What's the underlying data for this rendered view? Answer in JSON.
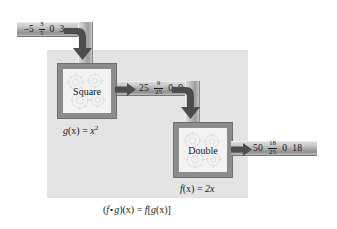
{
  "diagram": {
    "bottom_formula": "( f ∘ g )( x )  =  f [ g ( x ) ]",
    "bottom_formula_parts": {
      "open": "(",
      "f": "f",
      "ring": "∘",
      "g": "g",
      "close_x": ")(x)",
      "equals": "=",
      "f2": "f",
      "bracket_open": "[",
      "g2": "g",
      "gx": "(x)",
      "bracket_close": "]"
    },
    "panel_color": "#e3e3e3",
    "band_color": "#a8a8a8",
    "machine_border_color": "#8c8c8c",
    "arrow_color": "#4d4d4d"
  },
  "input_band": {
    "name": "input-values",
    "values": [
      {
        "type": "number",
        "text": "–5"
      },
      {
        "type": "fraction",
        "numerator": "3",
        "denominator": "5"
      },
      {
        "type": "number",
        "text": "0"
      },
      {
        "type": "number",
        "text": "3"
      }
    ]
  },
  "middle_band": {
    "name": "intermediate-values",
    "values": [
      {
        "type": "number",
        "text": "25"
      },
      {
        "type": "fraction",
        "numerator": "9",
        "denominator": "25"
      },
      {
        "type": "number",
        "text": "0"
      },
      {
        "type": "number",
        "text": "9"
      }
    ]
  },
  "output_band": {
    "name": "output-values",
    "values": [
      {
        "type": "number",
        "text": "50"
      },
      {
        "type": "fraction",
        "numerator": "18",
        "denominator": "25"
      },
      {
        "type": "number",
        "text": "0"
      },
      {
        "type": "number",
        "text": "18"
      }
    ]
  },
  "machine_square": {
    "label": "Square",
    "caption_fn": "g",
    "caption_arg": "(x)",
    "caption_eq": "=",
    "caption_body": "x",
    "caption_exp": "2"
  },
  "machine_double": {
    "label": "Double",
    "caption_fn": "f",
    "caption_arg": "(x)",
    "caption_eq": "=",
    "caption_body": "2x"
  },
  "icons": {
    "gear": "gear-icon",
    "arrow_right": "arrow-right-icon",
    "arrow_elbow_down": "arrow-elbow-down-icon"
  }
}
